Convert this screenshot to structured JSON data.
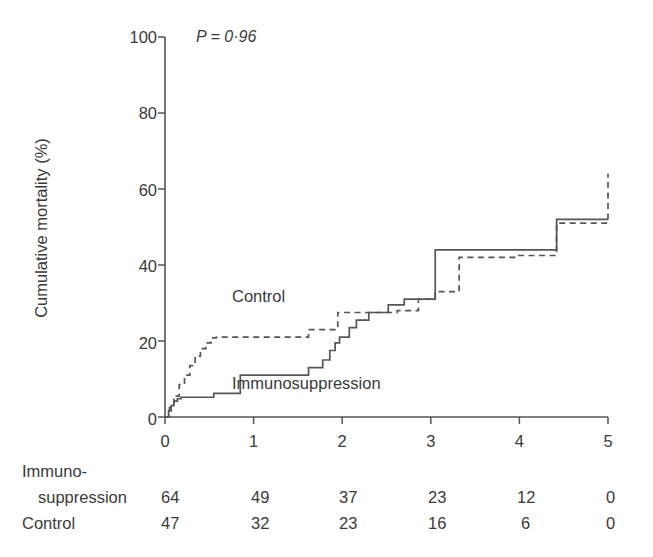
{
  "chart_data": {
    "type": "line",
    "title": "",
    "xlabel": "Year",
    "ylabel": "Cumulative mortality (%)",
    "xlim": [
      0,
      5
    ],
    "ylim": [
      0,
      100
    ],
    "xticks": [
      "0",
      "1",
      "2",
      "3",
      "4",
      "5"
    ],
    "yticks": [
      "0",
      "20",
      "40",
      "60",
      "80",
      "100"
    ],
    "grid": false,
    "legend_position": "inline-annotation",
    "annotation": "P = 0·96",
    "annotation_plain": "P = 0.96",
    "curve_style": "kaplan-meier-step",
    "series": [
      {
        "name": "Immunosuppression",
        "line_style": "solid",
        "label_x": 1.2,
        "label_y": 9,
        "final_value": 52,
        "steps_x": [
          0.0,
          0.04,
          0.07,
          0.1,
          0.14,
          0.18,
          0.55,
          0.85,
          1.3,
          1.62,
          1.78,
          1.86,
          1.92,
          1.97,
          2.02,
          2.08,
          2.16,
          2.3,
          2.52,
          2.7,
          2.98,
          3.05,
          4.42,
          5.0
        ],
        "steps_y": [
          0.0,
          1.6,
          3.0,
          4.2,
          4.8,
          5.2,
          6.2,
          11.0,
          11.0,
          13.0,
          15.0,
          17.5,
          19.5,
          21.0,
          21.0,
          23.5,
          25.5,
          27.5,
          29.5,
          31.0,
          31.0,
          44.0,
          52.0,
          52.0
        ]
      },
      {
        "name": "Control",
        "line_style": "dashed",
        "label_x": 0.95,
        "label_y": 31,
        "final_value": 64,
        "steps_x": [
          0.0,
          0.05,
          0.1,
          0.16,
          0.22,
          0.28,
          0.34,
          0.4,
          0.46,
          0.52,
          0.58,
          1.38,
          1.62,
          1.95,
          2.12,
          2.62,
          2.86,
          3.05,
          3.32,
          3.98,
          4.42,
          5.0
        ],
        "steps_y": [
          0.0,
          2.5,
          5.5,
          8.5,
          11.0,
          13.5,
          16.0,
          18.0,
          19.5,
          20.8,
          21.0,
          21.0,
          23.0,
          27.5,
          27.5,
          28.0,
          31.0,
          33.0,
          42.0,
          42.5,
          51.0,
          64.0
        ]
      }
    ]
  },
  "axes": {
    "y_label": "Cumulative mortality (%)",
    "x_label": "Year",
    "y_ticks": [
      "100",
      "80",
      "60",
      "40",
      "20",
      "0"
    ],
    "x_ticks": [
      "0",
      "1",
      "2",
      "3",
      "4",
      "5"
    ]
  },
  "annotations": {
    "p_value": "P = 0·96",
    "control_label": "Control",
    "immunosuppression_label": "Immunosuppression"
  },
  "risk_table": {
    "row1_name_line1": "Immuno-",
    "row1_name_line2": "suppression",
    "row2_name": "Control",
    "rows": [
      {
        "label": "Immuno-suppression",
        "values": [
          "64",
          "49",
          "37",
          "23",
          "12",
          "0"
        ]
      },
      {
        "label": "Control",
        "values": [
          "47",
          "32",
          "23",
          "16",
          "6",
          "0"
        ]
      }
    ]
  },
  "colors": {
    "ink": "#3a3a3a",
    "line": "#555555",
    "background": "#ffffff"
  }
}
